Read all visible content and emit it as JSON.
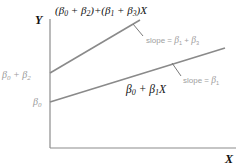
{
  "diagram": {
    "axes": {
      "y_label": "Y",
      "x_label": "X",
      "color": "#8c8c8c"
    },
    "lines": [
      {
        "name": "upper",
        "equation": "(β0 + β2)+(β1 + β3)X",
        "equation_parts": {
          "open1": "(",
          "b0": "β",
          "s0": "0",
          "plus1": " + ",
          "b2": "β",
          "s2": "2",
          "close1": ")+(",
          "b1": "β",
          "s1": "1",
          "plus2": " + ",
          "b3": "β",
          "s3": "3",
          "close2": ")X"
        },
        "intercept_label": {
          "b0": "β",
          "s0": "0",
          "plus": " + ",
          "b2": "β",
          "s2": "2"
        },
        "slope_label": {
          "prefix": "slope = ",
          "b1": "β",
          "s1": "1",
          "plus": " + ",
          "b3": "β",
          "s3": "3"
        },
        "color": "#8a8a8a"
      },
      {
        "name": "lower",
        "equation": "β0 + β1X",
        "equation_parts": {
          "b0": "β",
          "s0": "0",
          "plus": " + ",
          "b1": "β",
          "s1": "1",
          "x": "X"
        },
        "intercept_label": {
          "b0": "β",
          "s0": "0"
        },
        "slope_label": {
          "prefix": "slope = ",
          "b1": "β",
          "s1": "1"
        },
        "color": "#8a8a8a"
      }
    ]
  }
}
